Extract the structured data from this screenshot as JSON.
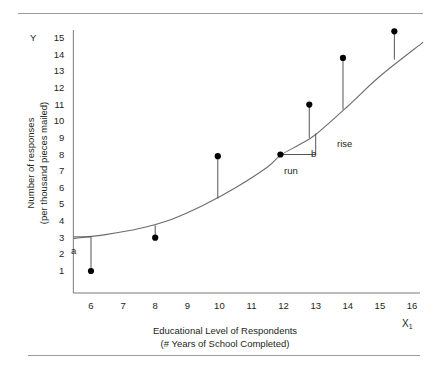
{
  "chart_data": {
    "type": "scatter",
    "title": "",
    "xlabel": "Educational Level of Respondents",
    "xlabel_line2": "(# Years of School Completed)",
    "ylabel": "Number of responses",
    "ylabel_line2": "(per thousand pieces mailed)",
    "x_symbol": "X",
    "x_symbol_sub": "1",
    "y_symbol": "Y",
    "xlim": [
      5.4,
      16.4
    ],
    "ylim": [
      0.3,
      15.8
    ],
    "xticks": [
      6,
      7,
      8,
      9,
      10,
      11,
      12,
      13,
      14,
      15,
      16
    ],
    "yticks": [
      1,
      2,
      3,
      4,
      5,
      6,
      7,
      8,
      9,
      10,
      11,
      12,
      13,
      14,
      15
    ],
    "grid": false,
    "legend": false,
    "points": [
      {
        "x": 6.0,
        "y": 1.0
      },
      {
        "x": 8.0,
        "y": 3.0
      },
      {
        "x": 9.95,
        "y": 7.9
      },
      {
        "x": 11.9,
        "y": 8.0
      },
      {
        "x": 12.8,
        "y": 11.0
      },
      {
        "x": 13.85,
        "y": 13.8
      },
      {
        "x": 15.45,
        "y": 15.4
      }
    ],
    "residual_lines": [
      {
        "x": 6.0,
        "y_point": 1.0,
        "y_curve": 3.05
      },
      {
        "x": 8.0,
        "y_point": 3.0,
        "y_curve": 3.75
      },
      {
        "x": 9.95,
        "y_point": 7.9,
        "y_curve": 5.35
      },
      {
        "x": 12.8,
        "y_point": 11.0,
        "y_curve": 9.0
      },
      {
        "x": 13.85,
        "y_point": 13.8,
        "y_curve": 10.7
      },
      {
        "x": 15.45,
        "y_point": 15.4,
        "y_curve": 13.7
      }
    ],
    "curve": {
      "description": "fitted regression curve, gently concave-up",
      "x_start": 5.45,
      "x_end": 16.35,
      "points": [
        {
          "x": 5.45,
          "y": 2.95
        },
        {
          "x": 6.5,
          "y": 3.2
        },
        {
          "x": 7.5,
          "y": 3.55
        },
        {
          "x": 8.5,
          "y": 4.1
        },
        {
          "x": 9.5,
          "y": 4.95
        },
        {
          "x": 10.5,
          "y": 6.0
        },
        {
          "x": 11.5,
          "y": 7.25
        },
        {
          "x": 11.9,
          "y": 7.95
        },
        {
          "x": 12.5,
          "y": 8.6
        },
        {
          "x": 13.0,
          "y": 9.2
        },
        {
          "x": 14.0,
          "y": 10.9
        },
        {
          "x": 15.0,
          "y": 12.7
        },
        {
          "x": 16.35,
          "y": 14.75
        }
      ]
    },
    "annotations": [
      {
        "label": "a",
        "meaning": "y-intercept",
        "x": 5.6,
        "y": 2.55
      },
      {
        "label": "b",
        "meaning": "slope",
        "x": 12.75,
        "y": 7.25
      },
      {
        "label": "rise",
        "meaning": "vertical change of slope triangle",
        "x": 13.3,
        "y": 7.9
      },
      {
        "label": "run",
        "meaning": "horizontal change of slope triangle",
        "x": 12.2,
        "y": 6.6
      }
    ],
    "slope_triangle": {
      "origin": {
        "x": 11.9,
        "y": 8.0
      },
      "corner": {
        "x": 13.0,
        "y": 8.0
      },
      "top": {
        "x": 13.0,
        "y": 9.25
      }
    },
    "intercept_marker": {
      "x_axis_value": 5.45,
      "y": 3.05
    },
    "colors": {
      "point": "#000000",
      "curve": "#6d6d6d",
      "axis": "#7a7a7a",
      "rule": "#9b9b9b",
      "text": "#231f20"
    }
  }
}
